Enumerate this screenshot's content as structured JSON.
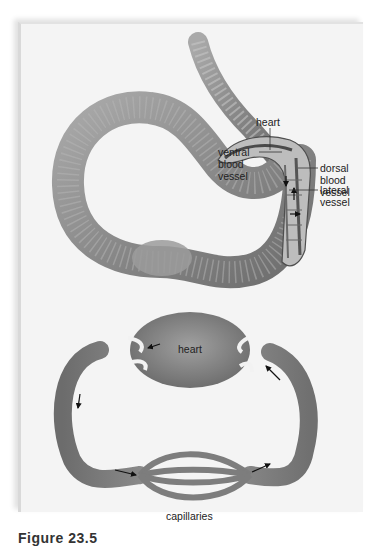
{
  "figure": {
    "caption": "Figure 23.5",
    "top_diagram": {
      "subject": "earthworm closed circulatory system",
      "labels": {
        "heart": "heart",
        "dorsal": "dorsal\nblood\nvessel",
        "ventral": "ventral\nblood\nvessel",
        "lateral": "lateral\nvessel"
      }
    },
    "bottom_diagram": {
      "subject": "closed circulation loop",
      "labels": {
        "heart": "heart",
        "capillaries": "capillaries"
      }
    },
    "colors": {
      "background": "#ffffff",
      "panel": "#f4f4f4",
      "worm_body": "#8c8c8c",
      "vessel": "#7a7a7a",
      "label_text": "#222222"
    }
  }
}
